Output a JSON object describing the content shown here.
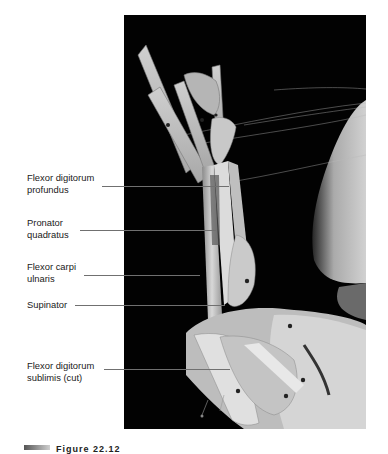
{
  "photo": {
    "alt": "Dissected cat forelimb, ventral view, showing forearm muscles pinned on black background"
  },
  "labels": [
    {
      "text": "Flexor digitorum\nprofundus",
      "y": 172,
      "line_y": 186,
      "line_x1": 102,
      "line_x2": 229
    },
    {
      "text": "Pronator\nquadratus",
      "y": 217,
      "line_y": 230,
      "line_x1": 80,
      "line_x2": 216
    },
    {
      "text": "Flexor carpi\nulnaris",
      "y": 261,
      "line_y": 275,
      "line_x1": 84,
      "line_x2": 200
    },
    {
      "text": "Supinator",
      "y": 299,
      "line_y": 305,
      "line_x1": 75,
      "line_x2": 225
    },
    {
      "text": "Flexor digitorum\nsublimis (cut)",
      "y": 360,
      "line_y": 369,
      "line_x1": 104,
      "line_x2": 230
    }
  ],
  "caption": {
    "text": "Figure 22.12"
  }
}
